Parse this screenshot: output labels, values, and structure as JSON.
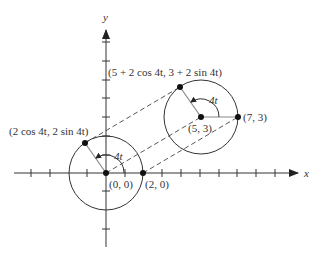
{
  "diagram": {
    "title": "",
    "axes": {
      "x_label": "x",
      "y_label": "y",
      "origin_px": [
        106,
        173
      ],
      "unit_px": 18.8,
      "x_ticks": [
        -5,
        -4,
        -3,
        -2,
        -1,
        1,
        2,
        3,
        4,
        5,
        6,
        7,
        8,
        9
      ],
      "y_ticks": [
        -4,
        -3,
        -2,
        -1,
        1,
        2,
        3,
        4,
        5,
        6,
        7
      ]
    },
    "circles": [
      {
        "name": "circle-at-origin",
        "center": [
          0,
          0
        ],
        "radius": 2
      },
      {
        "name": "circle-at-5-3",
        "center": [
          5,
          3
        ],
        "radius": 2
      }
    ],
    "points": [
      {
        "name": "origin-point",
        "coord": [
          0,
          0
        ],
        "label": "(0, 0)"
      },
      {
        "name": "point-2-0",
        "coord": [
          2,
          0
        ],
        "label": "(2, 0)"
      },
      {
        "name": "center-5-3",
        "coord": [
          5,
          3
        ],
        "label": "(5, 3)"
      },
      {
        "name": "point-7-3",
        "coord": [
          7,
          3
        ],
        "label": "(7, 3)"
      },
      {
        "name": "rotating-point-lower",
        "coord": [
          -1.13,
          1.62
        ],
        "label": "(2 cos 4t, 2 sin 4t)"
      },
      {
        "name": "rotating-point-upper",
        "coord": [
          3.87,
          4.62
        ],
        "label": "(5 + 2 cos 4t, 3 + 2 sin 4t)"
      }
    ],
    "angle_labels": [
      {
        "name": "angle-4t-lower",
        "text": "4t"
      },
      {
        "name": "angle-4t-upper",
        "text": "4t"
      }
    ],
    "dashed_translations": [
      {
        "from": [
          0,
          0
        ],
        "to": [
          5,
          3
        ]
      },
      {
        "from": [
          2,
          0
        ],
        "to": [
          7,
          3
        ]
      },
      {
        "from": [
          -1.13,
          1.62
        ],
        "to": [
          3.87,
          4.62
        ]
      }
    ],
    "colors": {
      "ink": "#333333",
      "radius_line": "#888888",
      "point": "#111111"
    }
  }
}
